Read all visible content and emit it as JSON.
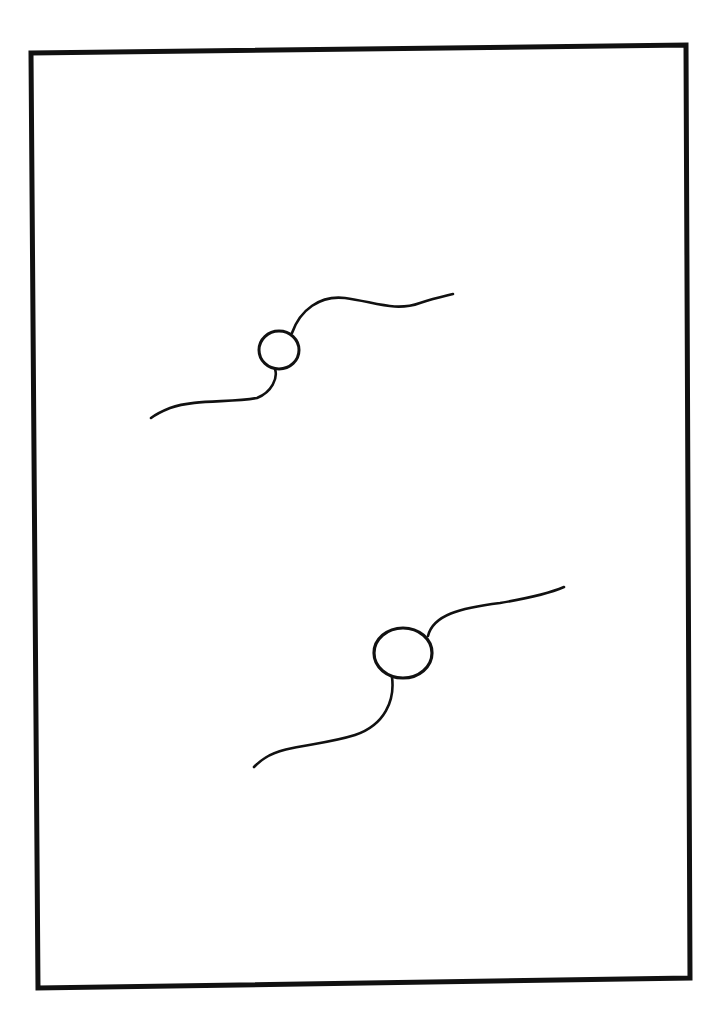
{
  "drawing": {
    "background": "#ffffff",
    "stroke_color": "#111111",
    "frame": {
      "points": "31,53 686,45 690,978 38,988",
      "stroke_width": 5
    },
    "figures": [
      {
        "name": "upper-figure",
        "circle": {
          "cx": 279,
          "cy": 350,
          "rx": 20,
          "ry": 19
        },
        "upper_curve": "M 292 333 C 300 310, 320 295, 345 298 C 375 302, 395 312, 420 303 C 435 298, 445 296, 453 294",
        "lower_curve": "M 275 369 C 278 378, 272 392, 257 398 C 230 403, 195 399, 170 408 C 160 412, 155 415, 151 418"
      },
      {
        "name": "lower-figure",
        "circle": {
          "cx": 403,
          "cy": 653,
          "rx": 29,
          "ry": 25
        },
        "upper_curve": "M 428 636 C 433 615, 460 608, 500 603 C 530 598, 550 593, 564 587",
        "lower_curve": "M 392 677 C 395 700, 385 725, 355 735 C 320 746, 285 745, 265 758 C 260 761, 257 764, 254 767"
      }
    ]
  }
}
